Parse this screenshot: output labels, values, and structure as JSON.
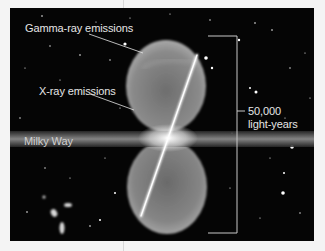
{
  "figure": {
    "labels": {
      "gamma": "Gamma-ray emissions",
      "xray": "X-ray emissions",
      "milky_way": "Milky Way",
      "scale_value": "50,000",
      "scale_unit": "light-years"
    },
    "colors": {
      "background": "#050505",
      "margin": "#f4f4f4",
      "label_text": "#e6e6e6",
      "bracket": "#c8c8c8",
      "bubble": "#9a9a9a",
      "jet": "#f5f5f5"
    }
  }
}
